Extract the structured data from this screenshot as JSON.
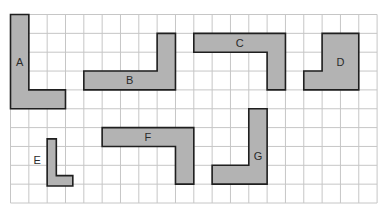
{
  "diagram": {
    "title": "",
    "grid": {
      "cols": 20,
      "rows": 10,
      "origin_x": 10.5,
      "origin_y": 14.5,
      "cell_w": 18.33,
      "cell_h": 18.85,
      "background": "#ffffff",
      "line_color": "#c6c6c6"
    },
    "shape_fill": "#b3b3b3",
    "shape_stroke": "#1f1f1f",
    "shapes": [
      {
        "label": "A",
        "points": [
          [
            0,
            0
          ],
          [
            1,
            0
          ],
          [
            1,
            4
          ],
          [
            3,
            4
          ],
          [
            3,
            5
          ],
          [
            0,
            5
          ]
        ],
        "label_pos": [
          0.5,
          2.5
        ]
      },
      {
        "label": "B",
        "points": [
          [
            8,
            1
          ],
          [
            9,
            1
          ],
          [
            9,
            4
          ],
          [
            4,
            4
          ],
          [
            4,
            3
          ],
          [
            8,
            3
          ]
        ],
        "label_pos": [
          6.5,
          3.5
        ]
      },
      {
        "label": "C",
        "points": [
          [
            10,
            1
          ],
          [
            15,
            1
          ],
          [
            15,
            4
          ],
          [
            14,
            4
          ],
          [
            14,
            2
          ],
          [
            10,
            2
          ]
        ],
        "label_pos": [
          12.5,
          1.5
        ]
      },
      {
        "label": "D",
        "points": [
          [
            17,
            1
          ],
          [
            19,
            1
          ],
          [
            19,
            4
          ],
          [
            16,
            4
          ],
          [
            16,
            3
          ],
          [
            17,
            3
          ]
        ],
        "label_pos": [
          18,
          2.5
        ]
      },
      {
        "label": "E",
        "points": [
          [
            2,
            6.6
          ],
          [
            2.5,
            6.6
          ],
          [
            2.5,
            8.55
          ],
          [
            3.4,
            8.55
          ],
          [
            3.4,
            9.1
          ],
          [
            2,
            9.1
          ]
        ],
        "label_pos": [
          1.45,
          7.7
        ]
      },
      {
        "label": "F",
        "points": [
          [
            5,
            6
          ],
          [
            10,
            6
          ],
          [
            10,
            9
          ],
          [
            9,
            9
          ],
          [
            9,
            7
          ],
          [
            5,
            7
          ]
        ],
        "label_pos": [
          7.5,
          6.5
        ]
      },
      {
        "label": "G",
        "points": [
          [
            13,
            5
          ],
          [
            14,
            5
          ],
          [
            14,
            9
          ],
          [
            11,
            9
          ],
          [
            11,
            8
          ],
          [
            13,
            8
          ]
        ],
        "label_pos": [
          13.5,
          7.5
        ]
      }
    ]
  }
}
